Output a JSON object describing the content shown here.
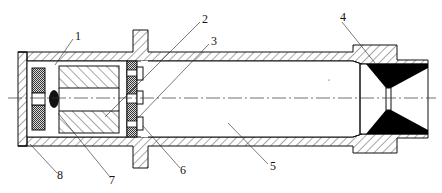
{
  "diagram": {
    "type": "mechanical-cross-section",
    "labels": [
      {
        "id": "1",
        "text": "1",
        "x": 75,
        "y": 40
      },
      {
        "id": "2",
        "text": "2",
        "x": 202,
        "y": 23
      },
      {
        "id": "3",
        "text": "3",
        "x": 211,
        "y": 45
      },
      {
        "id": "4",
        "text": "4",
        "x": 343,
        "y": 22
      },
      {
        "id": "5",
        "text": "5",
        "x": 271,
        "y": 167
      },
      {
        "id": "6",
        "text": "6",
        "x": 181,
        "y": 172
      },
      {
        "id": "7",
        "text": "7",
        "x": 111,
        "y": 181
      },
      {
        "id": "8",
        "text": "8",
        "x": 59,
        "y": 177
      }
    ],
    "colors": {
      "line": "#111111",
      "background": "#ffffff",
      "solid_fill": "#000000",
      "stipple_fill": "#555555"
    }
  }
}
